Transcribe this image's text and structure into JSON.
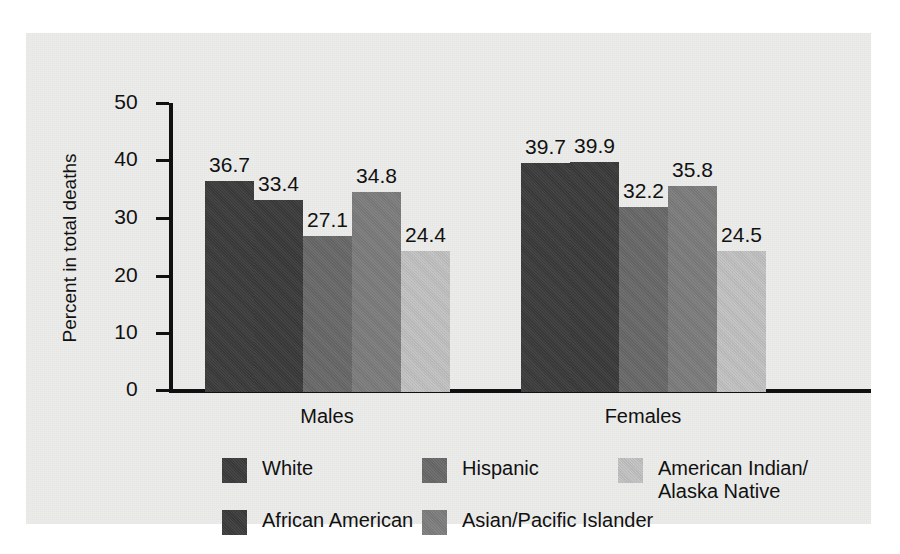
{
  "chart_data": {
    "type": "bar",
    "title": "",
    "xlabel": "",
    "ylabel": "Percent in total deaths",
    "ylim": [
      0,
      50
    ],
    "yticks": [
      0,
      10,
      20,
      30,
      40,
      50
    ],
    "ytick_labels": [
      "0",
      "10",
      "20",
      "30",
      "40",
      "50"
    ],
    "grid": false,
    "legend_position": "bottom",
    "categories": [
      "Males",
      "Females"
    ],
    "series": [
      {
        "name": "White",
        "values": [
          36.7,
          39.7
        ],
        "color": "#3c3c3c"
      },
      {
        "name": "African American",
        "values": [
          33.4,
          39.9
        ],
        "color": "#3b3b3b"
      },
      {
        "name": "Hispanic",
        "values": [
          27.1,
          32.2
        ],
        "color": "#696969"
      },
      {
        "name": "Asian/Pacific Islander",
        "values": [
          34.8,
          35.8
        ],
        "color": "#7d7d7d"
      },
      {
        "name": "American Indian/\nAlaska Native",
        "values": [
          24.4,
          24.5
        ],
        "color": "#c3c3c3"
      }
    ],
    "bar_labels": {
      "males": [
        "36.7",
        "33.4",
        "27.1",
        "34.8",
        "24.4"
      ],
      "females": [
        "39.7",
        "39.9",
        "32.2",
        "35.8",
        "24.5"
      ]
    }
  },
  "legend": {
    "entries": [
      {
        "label": "White",
        "color": "#3c3c3c"
      },
      {
        "label": "African American",
        "color": "#3b3b3b"
      },
      {
        "label": "Hispanic",
        "color": "#696969"
      },
      {
        "label": "Asian/Pacific Islander",
        "color": "#7d7d7d"
      },
      {
        "label": "American Indian/\nAlaska Native",
        "color": "#c3c3c3"
      }
    ]
  },
  "colors": {
    "panel_background": "#ececeb",
    "page_background": "#ffffff",
    "axis": "#111111",
    "text": "#111111"
  }
}
